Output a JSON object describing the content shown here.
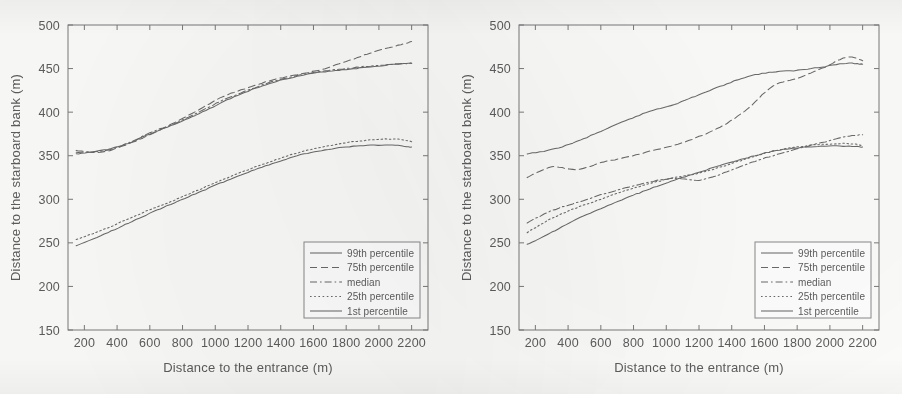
{
  "figure": {
    "background_color": "#fdfdfc",
    "ink_color": "#6a6a6a",
    "axis_color": "#7b7b7b",
    "panel_count": 2
  },
  "chart_data": [
    {
      "type": "line",
      "panel_name": "left-panel",
      "title": "",
      "xlabel": "Distance to the entrance (m)",
      "ylabel": "Distance to the starboard bank (m)",
      "xlim": [
        100,
        2300
      ],
      "ylim": [
        150,
        500
      ],
      "xticks": [
        200,
        400,
        600,
        800,
        1000,
        1200,
        1400,
        1600,
        1800,
        2000,
        2200
      ],
      "yticks": [
        150,
        200,
        250,
        300,
        350,
        400,
        450,
        500
      ],
      "grid": false,
      "legend_position": "lower right",
      "x": [
        150,
        300,
        450,
        600,
        750,
        900,
        1050,
        1200,
        1350,
        1500,
        1650,
        1800,
        1950,
        2100,
        2200
      ],
      "series": [
        {
          "name": "99th percentile",
          "dash": "solid",
          "values": [
            352,
            356,
            363,
            375,
            386,
            398,
            412,
            424,
            434,
            441,
            446,
            449,
            452,
            455,
            456
          ]
        },
        {
          "name": "75th percentile",
          "dash": "dashed",
          "values": [
            356,
            354,
            362,
            374,
            388,
            403,
            418,
            428,
            437,
            443,
            449,
            458,
            468,
            476,
            481
          ]
        },
        {
          "name": "median",
          "dash": "dashdot",
          "values": [
            354,
            355,
            363,
            376,
            387,
            400,
            414,
            425,
            435,
            442,
            447,
            450,
            453,
            455,
            456
          ]
        },
        {
          "name": "25th percentile",
          "dash": "dotted",
          "values": [
            254,
            264,
            276,
            288,
            299,
            311,
            323,
            334,
            344,
            353,
            360,
            365,
            368,
            369,
            366
          ]
        },
        {
          "name": "1st percentile",
          "dash": "solid",
          "values": [
            247,
            258,
            271,
            284,
            296,
            308,
            320,
            331,
            341,
            350,
            356,
            360,
            362,
            362,
            360
          ]
        }
      ]
    },
    {
      "type": "line",
      "panel_name": "right-panel",
      "title": "",
      "xlabel": "Distance to the entrance (m)",
      "ylabel": "Distance to the starboard bank (m)",
      "xlim": [
        100,
        2300
      ],
      "ylim": [
        150,
        500
      ],
      "xticks": [
        200,
        400,
        600,
        800,
        1000,
        1200,
        1400,
        1600,
        1800,
        2000,
        2200
      ],
      "yticks": [
        150,
        200,
        250,
        300,
        350,
        400,
        450,
        500
      ],
      "grid": false,
      "legend_position": "lower right",
      "x": [
        150,
        300,
        450,
        600,
        750,
        900,
        1050,
        1200,
        1350,
        1500,
        1650,
        1800,
        1950,
        2100,
        2200
      ],
      "series": [
        {
          "name": "99th percentile",
          "dash": "solid",
          "values": [
            352,
            357,
            366,
            378,
            390,
            401,
            409,
            420,
            431,
            441,
            446,
            448,
            452,
            456,
            455
          ]
        },
        {
          "name": "75th percentile",
          "dash": "dashed",
          "values": [
            325,
            337,
            334,
            342,
            348,
            355,
            362,
            372,
            385,
            404,
            430,
            439,
            450,
            463,
            459
          ]
        },
        {
          "name": "median",
          "dash": "dashdot",
          "values": [
            273,
            287,
            296,
            305,
            313,
            320,
            324,
            322,
            330,
            341,
            350,
            358,
            365,
            372,
            374
          ]
        },
        {
          "name": "25th percentile",
          "dash": "dotted",
          "values": [
            262,
            278,
            290,
            300,
            310,
            318,
            325,
            330,
            338,
            347,
            355,
            360,
            363,
            364,
            362
          ]
        },
        {
          "name": "1st percentile",
          "dash": "solid",
          "values": [
            248,
            262,
            277,
            289,
            301,
            312,
            322,
            331,
            340,
            348,
            355,
            359,
            361,
            361,
            360
          ]
        }
      ]
    }
  ],
  "legend": {
    "entries": [
      {
        "label": "99th percentile",
        "dash": "solid"
      },
      {
        "label": "75th percentile",
        "dash": "dashed"
      },
      {
        "label": "median",
        "dash": "dashdot"
      },
      {
        "label": "25th percentile",
        "dash": "dotted"
      },
      {
        "label": "1st percentile",
        "dash": "solid"
      }
    ]
  }
}
